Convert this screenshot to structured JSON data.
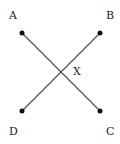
{
  "diagram": {
    "points": {
      "A": {
        "label": "A",
        "x": 22,
        "y": 33,
        "lx": 13,
        "ly": 19
      },
      "B": {
        "label": "B",
        "x": 100,
        "y": 33,
        "lx": 110,
        "ly": 19
      },
      "C": {
        "label": "C",
        "x": 100,
        "y": 111,
        "lx": 110,
        "ly": 135
      },
      "D": {
        "label": "D",
        "x": 22,
        "y": 111,
        "lx": 13,
        "ly": 135
      }
    },
    "segments": [
      [
        "A",
        "C"
      ],
      [
        "B",
        "D"
      ]
    ],
    "intersection": {
      "label": "X",
      "x": 61,
      "y": 72,
      "lx": 77,
      "ly": 75
    },
    "colors": {
      "line": "#555555",
      "dot": "#111111",
      "text": "#222222"
    }
  }
}
